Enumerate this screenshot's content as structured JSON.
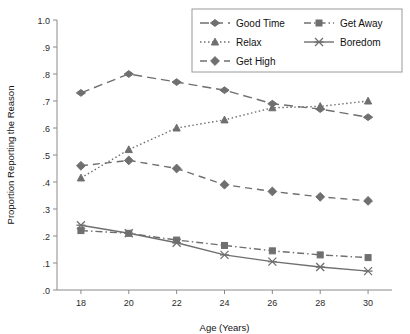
{
  "chart_data": {
    "type": "line",
    "title": "",
    "xlabel": "Age (Years)",
    "ylabel": "Proportion Reporting the Reason",
    "x": [
      18,
      20,
      22,
      24,
      26,
      28,
      30
    ],
    "xticklabels": [
      "18",
      "20",
      "22",
      "24",
      "26",
      "28",
      "30"
    ],
    "xlim": [
      17,
      31
    ],
    "ylim": [
      0.0,
      1.0
    ],
    "yticks": [
      0.0,
      0.1,
      0.2,
      0.3,
      0.4,
      0.5,
      0.6,
      0.7,
      0.8,
      0.9,
      1.0
    ],
    "yticklabels": [
      ".0",
      ".1",
      ".2",
      ".3",
      ".4",
      ".5",
      ".6",
      ".7",
      ".8",
      ".9",
      "1.0"
    ],
    "grid": false,
    "legend_position": "top-right",
    "series": [
      {
        "name": "Good Time",
        "marker": "diamond",
        "dash": "long-dash",
        "values": [
          0.73,
          0.8,
          0.77,
          0.74,
          0.69,
          0.67,
          0.64
        ]
      },
      {
        "name": "Get Away",
        "marker": "square",
        "dash": "dash-dot",
        "values": [
          0.22,
          0.21,
          0.185,
          0.165,
          0.145,
          0.13,
          0.12
        ]
      },
      {
        "name": "Relax",
        "marker": "triangle",
        "dash": "dotted",
        "values": [
          0.415,
          0.52,
          0.6,
          0.63,
          0.675,
          0.68,
          0.7
        ]
      },
      {
        "name": "Boredom",
        "marker": "cross",
        "dash": "solid",
        "values": [
          0.24,
          0.21,
          0.175,
          0.13,
          0.105,
          0.085,
          0.07
        ]
      },
      {
        "name": "Get High",
        "marker": "bigdiamond",
        "dash": "dash",
        "values": [
          0.46,
          0.48,
          0.45,
          0.39,
          0.365,
          0.345,
          0.33
        ]
      }
    ]
  },
  "legend": {
    "entries": [
      {
        "label": "Good Time"
      },
      {
        "label": "Get Away"
      },
      {
        "label": "Relax"
      },
      {
        "label": "Boredom"
      },
      {
        "label": "Get High"
      }
    ]
  },
  "colors": {
    "series": "#6f6f6f",
    "axis": "#8a8a8a",
    "text": "#111111"
  }
}
